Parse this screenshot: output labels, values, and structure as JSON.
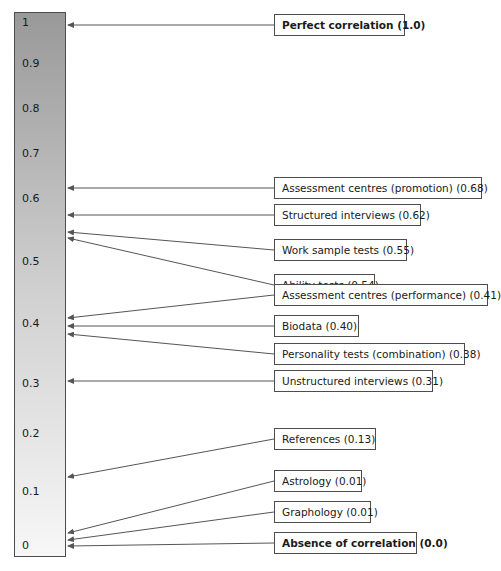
{
  "chart_data": {
    "type": "bar",
    "subtype": "annotated-gradient-scale",
    "orientation": "vertical",
    "axis": {
      "label": "Correlation coefficient",
      "min": 0,
      "max": 1,
      "tick_labels": [
        "1",
        "0.9",
        "0.8",
        "0.7",
        "0.6",
        "0.5",
        "0.4",
        "0.3",
        "0.2",
        "0.1",
        "0"
      ],
      "tick_values": [
        1,
        0.9,
        0.8,
        0.7,
        0.6,
        0.5,
        0.4,
        0.3,
        0.2,
        0.1,
        0
      ]
    },
    "gradient": {
      "top_color": "#999999",
      "bottom_color": "#f7f7f7",
      "description": "dark grey at 1.0 fading to near-white at 0.0"
    },
    "categories": [
      "Perfect correlation",
      "Assessment centres (promotion)",
      "Structured interviews",
      "Work sample tests",
      "Ability tests",
      "Assessment centres (performance)",
      "Biodata",
      "Personality tests (combination)",
      "Unstructured interviews",
      "References",
      "Astrology",
      "Graphology",
      "Absence of correlation"
    ],
    "values": [
      1.0,
      0.68,
      0.62,
      0.55,
      0.54,
      0.41,
      0.4,
      0.38,
      0.31,
      0.13,
      0.01,
      0.01,
      0.0
    ]
  },
  "scale": {
    "ticks": [
      {
        "label": "1",
        "top": 17
      },
      {
        "label": "0.9",
        "top": 58
      },
      {
        "label": "0.8",
        "top": 103
      },
      {
        "label": "0.7",
        "top": 148
      },
      {
        "label": "0.6",
        "top": 193
      },
      {
        "label": "0.5",
        "top": 256
      },
      {
        "label": "0.4",
        "top": 318
      },
      {
        "label": "0.3",
        "top": 378
      },
      {
        "label": "0.2",
        "top": 428
      },
      {
        "label": "0.1",
        "top": 486
      },
      {
        "label": "0",
        "top": 540
      }
    ]
  },
  "labels": [
    {
      "text": "Perfect correlation (1.0)",
      "top": 14,
      "width": 131,
      "bold": true,
      "arrow_y": 25,
      "line_y": 25
    },
    {
      "text": "Assessment centres (promotion) (0.68)",
      "top": 177,
      "width": 208,
      "bold": false,
      "arrow_y": 188,
      "line_y": 188
    },
    {
      "text": "Structured interviews (0.62)",
      "top": 204,
      "width": 147,
      "bold": false,
      "arrow_y": 215,
      "line_y": 215
    },
    {
      "text": "Work sample tests (0.55)",
      "top": 239,
      "width": 133,
      "bold": false,
      "arrow_y": 250,
      "line_y": 232
    },
    {
      "text": "Ability tests (0.54)",
      "top": 274,
      "width": 101,
      "bold": false,
      "arrow_y": 285,
      "line_y": 238
    },
    {
      "text": "Assessment centres (performance) (0.41)",
      "top": 284,
      "width": 214,
      "bold": false,
      "arrow_y": 295,
      "line_y": 318
    },
    {
      "text": "Biodata (0.40)",
      "top": 315,
      "width": 85,
      "bold": false,
      "arrow_y": 326,
      "line_y": 326
    },
    {
      "text": "Personality tests (combination) (0.38)",
      "top": 343,
      "width": 191,
      "bold": false,
      "arrow_y": 354,
      "line_y": 334
    },
    {
      "text": "Unstructured interviews (0.31)",
      "top": 370,
      "width": 159,
      "bold": false,
      "arrow_y": 381,
      "line_y": 381
    },
    {
      "text": "References (0.13)",
      "top": 428,
      "width": 102,
      "bold": false,
      "arrow_y": 439,
      "line_y": 477
    },
    {
      "text": "Astrology (0.01)",
      "top": 470,
      "width": 88,
      "bold": false,
      "arrow_y": 481,
      "line_y": 533
    },
    {
      "text": "Graphology (0.01)",
      "top": 501,
      "width": 97,
      "bold": false,
      "arrow_y": 512,
      "line_y": 540
    },
    {
      "text": "Absence of correlation (0.0)",
      "top": 532,
      "width": 143,
      "bold": true,
      "arrow_y": 543,
      "line_y": 546
    }
  ],
  "colors": {
    "bar_top": "#999999",
    "bar_bottom": "#f7f7f7",
    "outline": "#4d4d4d",
    "text": "#1a1a1a",
    "connector": "#555555"
  }
}
